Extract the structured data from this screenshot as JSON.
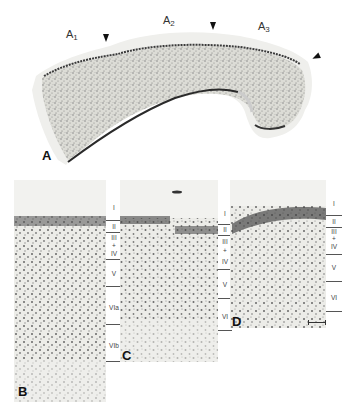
{
  "figure": {
    "panel_a": {
      "letter": "A",
      "regions": [
        {
          "name": "A",
          "sub": "1"
        },
        {
          "name": "A",
          "sub": "2"
        },
        {
          "name": "A",
          "sub": "3"
        }
      ],
      "arrowheads": 3
    },
    "panel_b": {
      "letter": "B",
      "layers": [
        "I",
        "II",
        "III",
        "+",
        "IV",
        "V",
        "VIa",
        "VIb"
      ]
    },
    "panel_c": {
      "letter": "C",
      "layers": [
        "I",
        "II",
        "III",
        "+",
        "IV",
        "V",
        "VI"
      ]
    },
    "panel_d": {
      "letter": "D",
      "layers": [
        "I",
        "II",
        "III",
        "+",
        "IV",
        "V",
        "VI"
      ],
      "scale_bar": true
    },
    "colors": {
      "background": "#ffffff",
      "tissue": "#e6e6e2",
      "stain_dark": "#2a2a2a",
      "text": "#222222"
    }
  }
}
